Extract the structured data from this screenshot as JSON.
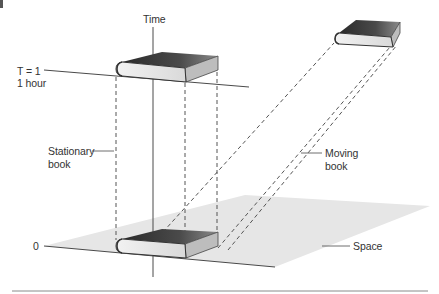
{
  "figure": {
    "panel_marker": "",
    "labels": {
      "time_axis": "Time",
      "t1_line1": "T = 1",
      "t1_line2": "1 hour",
      "stationary_line1": "Stationary",
      "stationary_line2": "book",
      "moving_line1": "Moving",
      "moving_line2": "book",
      "origin": "0",
      "space": "Space"
    },
    "colors": {
      "line": "#4a4a4a",
      "dashed": "#555555",
      "plane": "#e6e6e6",
      "book_cover_dark": "#2e2e2e",
      "book_cover_light": "#7a7a7a",
      "book_pages": "#e9e9e9",
      "text": "#333333"
    },
    "icons": [
      "book-icon-stationary-t1",
      "book-icon-stationary-t0",
      "book-icon-moving"
    ]
  }
}
